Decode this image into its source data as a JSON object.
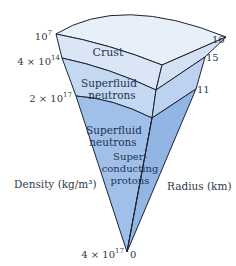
{
  "diagram": {
    "regions": [
      {
        "id": "crust",
        "label": "Crust"
      },
      {
        "id": "superfluid-outer",
        "line1": "Superfluid",
        "line2": "neutrons"
      },
      {
        "id": "superfluid-inner",
        "line1": "Superfluid",
        "line2": "neutrons"
      },
      {
        "id": "core-protons",
        "line1": "Super-",
        "line2": "conducting",
        "line3": "protons"
      }
    ],
    "density_axis": {
      "label": "Density (kg/m³)",
      "ticks": [
        {
          "base": "10",
          "exp": "7"
        },
        {
          "base": "4 × 10",
          "exp": "14"
        },
        {
          "base": "2 × 10",
          "exp": "17"
        },
        {
          "base": "4 × 10",
          "exp": "17"
        }
      ]
    },
    "radius_axis": {
      "label": "Radius (km)",
      "ticks": [
        "16",
        "15",
        "11",
        "0"
      ]
    },
    "colors": {
      "crust": "#dbe7f6",
      "crust_top": "#e6eef9",
      "superfluid_outer": "#c2d6f0",
      "core": "#9ebfe8",
      "core_side": "#8fb2e0",
      "outline": "#1c2333"
    }
  }
}
